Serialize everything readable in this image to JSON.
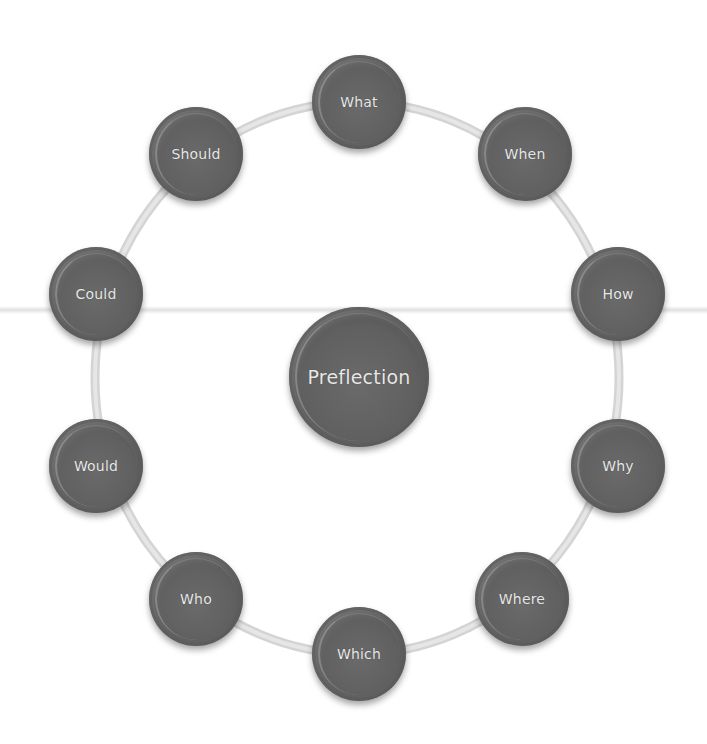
{
  "diagram": {
    "type": "cycle",
    "center": {
      "label": "Preflection",
      "x": 359,
      "y": 377,
      "r": 70
    },
    "ring": {
      "cx": 357,
      "cy": 378,
      "rx": 262,
      "ry": 276,
      "color": "#d4d4d4"
    },
    "nodes": [
      {
        "label": "What",
        "x": 359,
        "y": 102,
        "r": 47
      },
      {
        "label": "When",
        "x": 525,
        "y": 154,
        "r": 47
      },
      {
        "label": "How",
        "x": 618,
        "y": 294,
        "r": 47
      },
      {
        "label": "Why",
        "x": 618,
        "y": 466,
        "r": 47
      },
      {
        "label": "Where",
        "x": 522,
        "y": 599,
        "r": 47
      },
      {
        "label": "Which",
        "x": 359,
        "y": 654,
        "r": 47
      },
      {
        "label": "Who",
        "x": 196,
        "y": 599,
        "r": 47
      },
      {
        "label": "Would",
        "x": 96,
        "y": 466,
        "r": 47
      },
      {
        "label": "Could",
        "x": 96,
        "y": 294,
        "r": 47
      },
      {
        "label": "Should",
        "x": 196,
        "y": 154,
        "r": 47
      }
    ],
    "colors": {
      "node": "#5f5f5f",
      "text": "#e8e8e8",
      "ring": "#d4d4d4"
    }
  }
}
